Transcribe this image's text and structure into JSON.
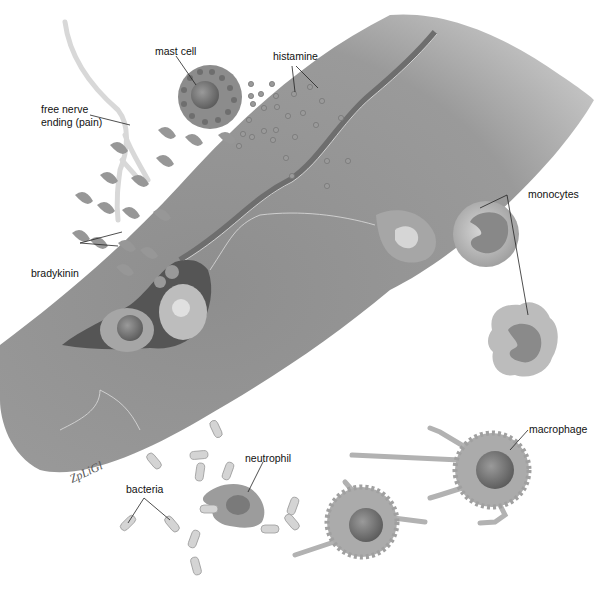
{
  "figure": {
    "signature": "ZpLiGl"
  },
  "labels": {
    "mast_cell": "mast cell",
    "histamine": "histamine",
    "free_nerve_ending_line1": "free nerve",
    "free_nerve_ending_line2": "ending (pain)",
    "monocytes": "monocytes",
    "bradykinin": "bradykinin",
    "neutrophil": "neutrophil",
    "bacteria": "bacteria",
    "macrophage": "macrophage"
  },
  "colors": {
    "vessel": "#8a8a8a",
    "vessel_light": "#b0b0b0",
    "cell_fill": "#a8a8a8",
    "nucleus": "#6a6a6a",
    "bacteria": "#cfcfcf",
    "label_line": "#222222"
  }
}
